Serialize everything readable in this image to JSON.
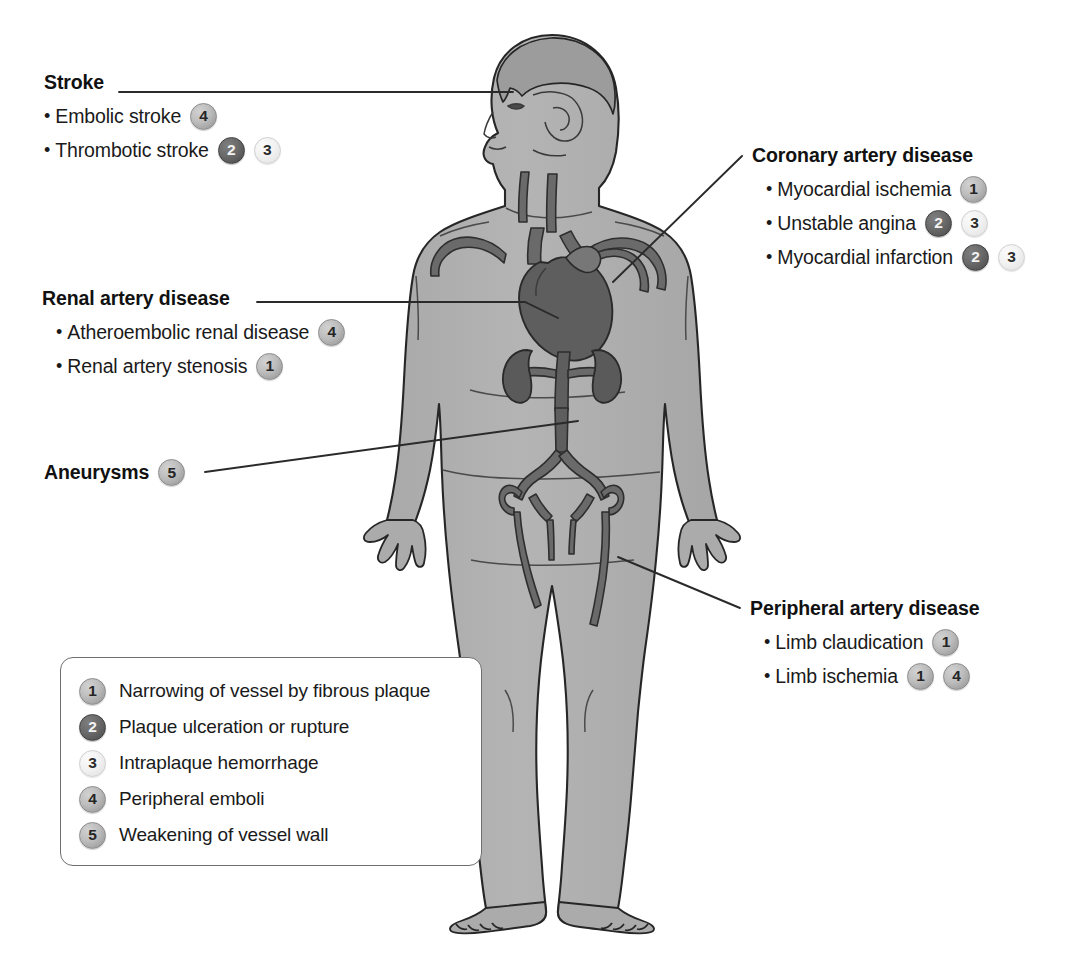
{
  "figure": {
    "body_fill": "#b0b0b0",
    "vessel_fill": "#6a6a6a",
    "organ_fill": "#5e5e5e",
    "outline": "#262626",
    "leader_line_color": "#2a2a2a"
  },
  "callouts": [
    {
      "id": "stroke",
      "title": "Stroke",
      "items": [
        {
          "label": "Embolic stroke",
          "badges": [
            "4"
          ]
        },
        {
          "label": "Thrombotic stroke",
          "badges": [
            "2",
            "3"
          ]
        }
      ]
    },
    {
      "id": "coronary-artery-disease",
      "title": "Coronary artery disease",
      "items": [
        {
          "label": "Myocardial ischemia",
          "badges": [
            "1"
          ]
        },
        {
          "label": "Unstable angina",
          "badges": [
            "2",
            "3"
          ]
        },
        {
          "label": "Myocardial infarction",
          "badges": [
            "2",
            "3"
          ]
        }
      ]
    },
    {
      "id": "renal-artery-disease",
      "title": "Renal artery disease",
      "items": [
        {
          "label": "Atheroembolic renal disease",
          "badges": [
            "4"
          ]
        },
        {
          "label": "Renal artery stenosis",
          "badges": [
            "1"
          ]
        }
      ]
    },
    {
      "id": "aneurysms",
      "title": "Aneurysms",
      "items": [],
      "inline_badges": [
        "5"
      ]
    },
    {
      "id": "peripheral-artery-disease",
      "title": "Peripheral artery disease",
      "items": [
        {
          "label": "Limb claudication",
          "badges": [
            "1"
          ]
        },
        {
          "label": "Limb ischemia",
          "badges": [
            "1",
            "4"
          ]
        }
      ]
    }
  ],
  "legend": {
    "items": [
      {
        "number": "1",
        "text": "Narrowing of vessel by fibrous plaque"
      },
      {
        "number": "2",
        "text": "Plaque ulceration or rupture"
      },
      {
        "number": "3",
        "text": "Intraplaque hemorrhage"
      },
      {
        "number": "4",
        "text": "Peripheral emboli"
      },
      {
        "number": "5",
        "text": "Weakening of vessel wall"
      }
    ]
  },
  "bullet_glyph": "•"
}
